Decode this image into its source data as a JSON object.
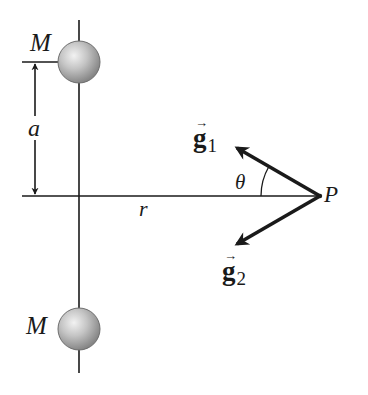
{
  "diagram": {
    "colors": {
      "line": "#1a1a1a",
      "sphere_light": "#e6e6e6",
      "sphere_mid": "#b8b8b8",
      "sphere_dark": "#808080",
      "background": "#ffffff"
    },
    "labels": {
      "mass_top": "M",
      "mass_bottom": "M",
      "separation": "a",
      "distance": "r",
      "angle": "θ",
      "point": "P",
      "field1_symbol": "g",
      "field1_subscript": "1",
      "field2_symbol": "g",
      "field2_subscript": "2",
      "vector_arrow": "→"
    },
    "geometry": {
      "axis_x": 79,
      "axis_y": 196,
      "top_mass_center": [
        79,
        62
      ],
      "bottom_mass_center": [
        79,
        329
      ],
      "mass_radius": 21,
      "point_P": [
        320,
        196
      ],
      "g1_tip": [
        235,
        147
      ],
      "g2_tip": [
        235,
        245
      ]
    }
  }
}
